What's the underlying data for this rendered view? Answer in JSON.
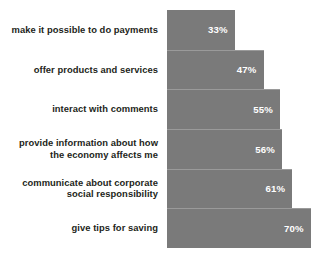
{
  "chart_data": {
    "type": "bar",
    "orientation": "horizontal",
    "title": "",
    "subtitle": "",
    "xlabel": "",
    "ylabel": "",
    "grid": false,
    "legend": null,
    "axis_visible": false,
    "value_suffix": "%",
    "xlim": [
      0,
      73
    ],
    "colors": {
      "bar": "#7a7a7a",
      "bar_separator": "#9a9a9a",
      "value_label": "#ffffff",
      "category_label": "#231f20",
      "background": "#ffffff"
    },
    "categories": [
      "make it possible to do payments",
      "offer products and services",
      "interact with comments",
      "provide information about how\nthe economy affects me",
      "communicate about corporate\nsocial responsibility",
      "give tips for saving"
    ],
    "values": [
      33,
      47,
      55,
      56,
      61,
      70
    ],
    "value_labels": [
      "33%",
      "47%",
      "55%",
      "56%",
      "61%",
      "70%"
    ]
  }
}
